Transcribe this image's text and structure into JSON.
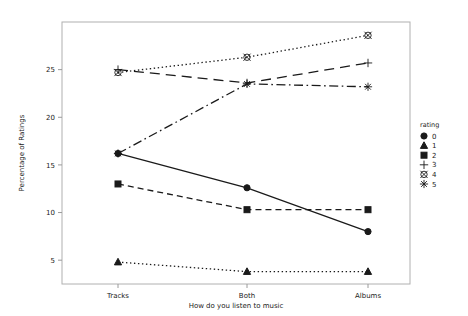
{
  "chart_data": {
    "type": "line",
    "title": "",
    "xlabel": "How do you listen to music",
    "ylabel": "Percentage of Ratings",
    "categories": [
      "Tracks",
      "Both",
      "Albums"
    ],
    "ylim": [
      2.5,
      30
    ],
    "yticks": [
      5,
      10,
      15,
      20,
      25
    ],
    "ytick_labels": [
      "5",
      "10",
      "15",
      "20",
      "25"
    ],
    "grid": false,
    "legend_position": "right",
    "legend_title": "rating",
    "series": [
      {
        "name": "0",
        "marker": "filled-circle",
        "linestyle": "solid",
        "values": [
          16.2,
          12.6,
          8.0
        ]
      },
      {
        "name": "1",
        "marker": "filled-triangle",
        "linestyle": "dotted",
        "values": [
          4.8,
          3.8,
          3.8
        ]
      },
      {
        "name": "2",
        "marker": "filled-square",
        "linestyle": "dashed",
        "values": [
          13.0,
          10.3,
          10.3
        ]
      },
      {
        "name": "3",
        "marker": "plus",
        "linestyle": "long-dash",
        "values": [
          25.0,
          23.6,
          25.7
        ]
      },
      {
        "name": "4",
        "marker": "circled-x",
        "linestyle": "dotted",
        "values": [
          24.7,
          26.3,
          28.6
        ]
      },
      {
        "name": "5",
        "marker": "asterisk",
        "linestyle": "dash-dot",
        "values": [
          16.2,
          23.5,
          23.2
        ]
      }
    ]
  },
  "axes": {
    "x_label": "How do you listen to music",
    "y_label": "Percentage of Ratings",
    "x_categories": [
      "Tracks",
      "Both",
      "Albums"
    ],
    "y_ticks": [
      "5",
      "10",
      "15",
      "20",
      "25"
    ]
  },
  "legend": {
    "title": "rating",
    "items": [
      {
        "label": "0",
        "marker": "filled-circle"
      },
      {
        "label": "1",
        "marker": "filled-triangle"
      },
      {
        "label": "2",
        "marker": "filled-square"
      },
      {
        "label": "3",
        "marker": "plus"
      },
      {
        "label": "4",
        "marker": "circled-x"
      },
      {
        "label": "5",
        "marker": "asterisk"
      }
    ]
  },
  "colors": {
    "ink": "#1a1a1a",
    "frame": "#b0b0b0",
    "background": "#ffffff"
  }
}
